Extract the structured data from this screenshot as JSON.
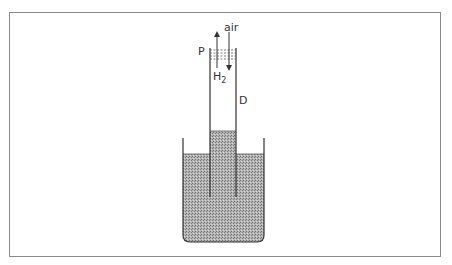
{
  "diagram": {
    "labels": {
      "air": "air",
      "P": "P",
      "H2_main": "H",
      "H2_sub": "2",
      "D": "D"
    },
    "colors": {
      "frame": "#8a8a8a",
      "line": "#333333",
      "liquid": "#a9a9a9",
      "liquid_dot": "#7a7a7a"
    }
  }
}
